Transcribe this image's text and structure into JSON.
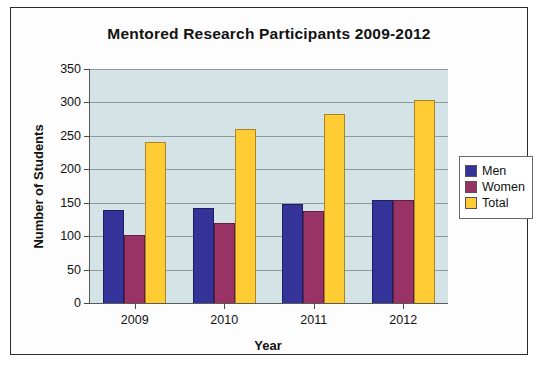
{
  "chart_data": {
    "type": "bar",
    "title": "Mentored Research Participants 2009-2012",
    "xlabel": "Year",
    "ylabel": "Number of Students",
    "categories": [
      "2009",
      "2010",
      "2011",
      "2012"
    ],
    "series": [
      {
        "name": "Men",
        "color": "#333399",
        "values": [
          139,
          142,
          148,
          154
        ]
      },
      {
        "name": "Women",
        "color": "#993366",
        "values": [
          101,
          119,
          138,
          154
        ]
      },
      {
        "name": "Total",
        "color": "#ffcc33",
        "values": [
          241,
          261,
          283,
          304
        ]
      }
    ],
    "ylim": [
      0,
      350
    ],
    "ytick_step": 50,
    "yticks": [
      0,
      50,
      100,
      150,
      200,
      250,
      300,
      350
    ],
    "ytick_labels": [
      "0",
      "50",
      "100",
      "150",
      "200",
      "250",
      "300",
      "350"
    ],
    "grid": true,
    "legend_position": "right",
    "plot_background": "#d4e3e6",
    "frame_background": "#fdfdfd"
  },
  "legend": {
    "entries": [
      {
        "label": "Men"
      },
      {
        "label": "Women"
      },
      {
        "label": "Total"
      }
    ]
  }
}
